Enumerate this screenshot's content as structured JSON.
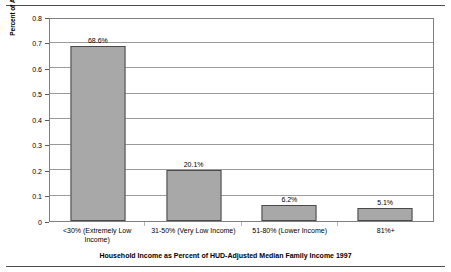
{
  "chart_data": {
    "type": "bar",
    "title": "",
    "xlabel": "Household Income as Percent of HUD-Adjusted Median Family Income 1997",
    "ylabel": "Percent of All Unassisted Renter Households With Priority Housing Problems",
    "categories": [
      "<30% (Extremely Low Income)",
      "31-50% (Very Low Income)",
      "51-80% (Lower Income)",
      "81%+"
    ],
    "category_lines": [
      [
        "<30% (Extremely Low",
        "Income)"
      ],
      [
        "31-50% (Very Low Income)"
      ],
      [
        "51-80% (Lower Income)"
      ],
      [
        "81%+"
      ]
    ],
    "values": [
      0.686,
      0.201,
      0.062,
      0.051
    ],
    "data_labels": [
      "68.6%",
      "20.1%",
      "6.2%",
      "5.1%"
    ],
    "ylim": [
      0,
      0.8
    ],
    "ytick_values": [
      0,
      0.1,
      0.2,
      0.3,
      0.4,
      0.5,
      0.6,
      0.7,
      0.8
    ],
    "ytick_labels": [
      "0",
      "0.1",
      "0.2",
      "0.3",
      "0.4",
      "0.5",
      "0.6",
      "0.7",
      "0.8"
    ],
    "grid": true,
    "legend": false,
    "bar_color": "#a8a8a8",
    "bar_edge_color": "#4a4a4a",
    "plot_border_color": "#808080",
    "gridline_color": "#9a9a9a"
  }
}
